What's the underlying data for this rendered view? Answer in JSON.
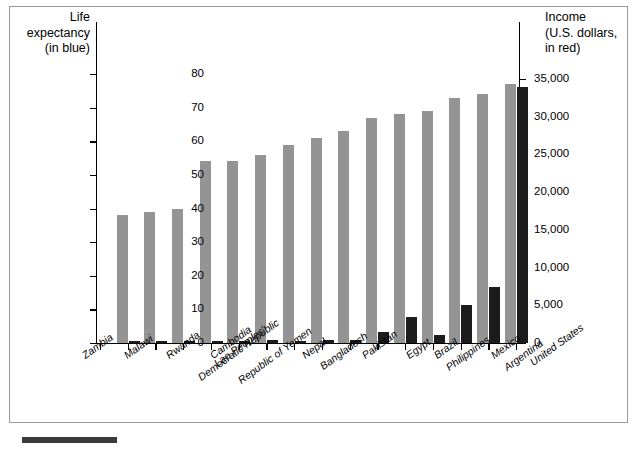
{
  "figure": {
    "left_axis_title": "Life\nexpectancy\n(in blue)",
    "right_axis_title": "Income\n(U.S. dollars,\nin red)",
    "left_tick_labels": [
      "0",
      "10",
      "20",
      "30",
      "40",
      "50",
      "60",
      "70",
      "80"
    ],
    "right_tick_labels": [
      "0",
      "5,000",
      "10,000",
      "15,000",
      "20,000",
      "25,000",
      "30,000",
      "35,000"
    ],
    "colors": {
      "life_bar": "#949494",
      "income_bar": "#1c1c1c",
      "axis": "#000000",
      "frame": "#9a9a9a",
      "background": "#ffffff"
    }
  },
  "chart_data": {
    "type": "bar",
    "title": "",
    "xlabel": "",
    "ylabel": "Life expectancy (in blue)",
    "y2label": "Income (U.S. dollars, in red)",
    "ylim": [
      0,
      85
    ],
    "y2lim": [
      0,
      37500
    ],
    "yticks": [
      0,
      10,
      20,
      30,
      40,
      50,
      60,
      70,
      80
    ],
    "y2ticks": [
      0,
      5000,
      10000,
      15000,
      20000,
      25000,
      30000,
      35000
    ],
    "grid": false,
    "legend": "encoded in axis titles",
    "categories": [
      "Zambia",
      "Malawi",
      "Rwanda",
      "Cambodia",
      "Lao Peoples' Democratic Republic",
      "Republic of Yemen",
      "Nepal",
      "Bangladesh",
      "Pakistan",
      "Egypt",
      "Brazil",
      "Philippines",
      "Mexico",
      "Argentina",
      "United States"
    ],
    "series": [
      {
        "name": "Life expectancy",
        "axis": "left",
        "unit": "years",
        "color": "#949494",
        "values": [
          38,
          39,
          40,
          54,
          54,
          56,
          59,
          61,
          63,
          67,
          68,
          69,
          73,
          74,
          77
        ]
      },
      {
        "name": "Income",
        "axis": "right",
        "unit": "U.S. dollars",
        "color": "#1c1c1c",
        "values": [
          320,
          170,
          230,
          260,
          310,
          350,
          230,
          360,
          410,
          1500,
          3500,
          1000,
          5000,
          7400,
          34000
        ]
      }
    ]
  }
}
